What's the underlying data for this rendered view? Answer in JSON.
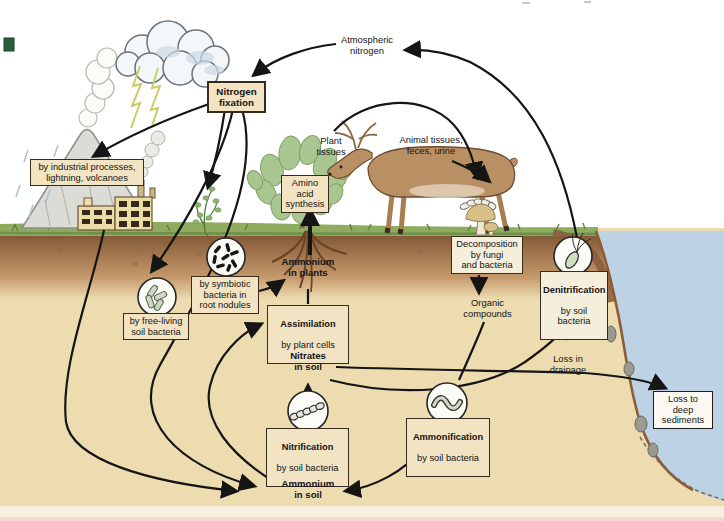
{
  "figure": {
    "name": "nitrogen-cycle-diagram"
  },
  "labels": {
    "atmospheric_nitrogen": "Atmospheric\nnitrogen",
    "plant_tissues": "Plant\ntissues",
    "animal_tissues": "Animal tissues,\nfeces, urine",
    "ammonium_in_plants": "Ammonium\nin plants",
    "nitrates_in_soil": "Nitrates\nin soil",
    "ammonium_in_soil": "Ammonium\nin soil",
    "organic_compounds": "Organic\ncompounds",
    "loss_in_drainage": "Loss in\ndrainage"
  },
  "boxes": {
    "nitrogen_fixation": {
      "title": "Nitrogen\nfixation"
    },
    "industrial": {
      "text": "by industrial processes,\nlightning, volcanoes"
    },
    "symbiotic": {
      "text": "by symbiotic\nbacteria in\nroot nodules"
    },
    "free_living": {
      "text": "by free-living\nsoil bacteria"
    },
    "amino_acid": {
      "text": "Amino acid\nsynthesis"
    },
    "assimilation": {
      "title": "Assimilation",
      "sub": "by plant cells"
    },
    "nitrification": {
      "title": "Nitrification",
      "sub": "by soil bacteria"
    },
    "ammonification": {
      "title": "Ammonification",
      "sub": "by soil bacteria"
    },
    "decomposition": {
      "text": "Decomposition\nby fungi\nand bacteria"
    },
    "denitrification": {
      "title": "Denitrification",
      "sub": "by soil\nbacteria"
    },
    "loss_sediments": {
      "text": "Loss to\ndeep\nsediments"
    }
  },
  "icons": {
    "cloud": "storm-cloud-icon",
    "lightning": "lightning-icon",
    "volcano": "volcano-icon",
    "factory": "factory-icon",
    "legume": "legume-plant-icon",
    "shrub": "shrub-icon",
    "deer": "deer-icon",
    "mushrooms": "mushrooms-icon",
    "root_nodule_bacteria": "root-nodule-bacteria-icon",
    "free_living_bacteria": "free-living-bacteria-icon",
    "nitrifying_bacteria": "nitrifying-bacteria-chain-icon",
    "ammonifying_bacteria": "ammonifying-bacteria-icon",
    "denitrifying_bacteria": "denitrifying-bacteria-icon"
  },
  "colors": {
    "box_fill": "#f2e3c2",
    "box_border": "#372b1e",
    "soil": "#ecdcb0",
    "topsoil": "#7d5331",
    "grass": "#8fac5e",
    "water": "#bdd2e4",
    "arrow": "#151515",
    "page_strip": "#f7efdf",
    "corner_marker_green": "#2c5e3a"
  }
}
